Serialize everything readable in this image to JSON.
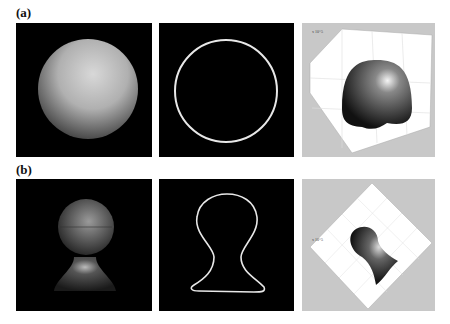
{
  "figure": {
    "rows": [
      {
        "label": "(a)",
        "panels": [
          {
            "name": "shaded-sphere",
            "background": "#000000"
          },
          {
            "name": "circle-contour",
            "background": "#000000"
          },
          {
            "name": "3d-surface-plot",
            "background": "#c8c8c8",
            "axis_exponent": "x 10^5",
            "tick_labels": [
              "0",
              "50",
              "100",
              "150",
              "200",
              "250",
              "300",
              "50",
              "100",
              "150",
              "200",
              "250"
            ]
          }
        ]
      },
      {
        "label": "(b)",
        "panels": [
          {
            "name": "shaded-keyhole-shape",
            "background": "#000000"
          },
          {
            "name": "keyhole-contour",
            "background": "#000000"
          },
          {
            "name": "3d-surface-plot-rotated",
            "background": "#c8c8c8",
            "axis_exponent": "x 10^5",
            "tick_labels": [
              "0",
              "50",
              "100",
              "150",
              "200",
              "250",
              "50",
              "100",
              "150",
              "200",
              "250"
            ]
          }
        ]
      }
    ]
  }
}
